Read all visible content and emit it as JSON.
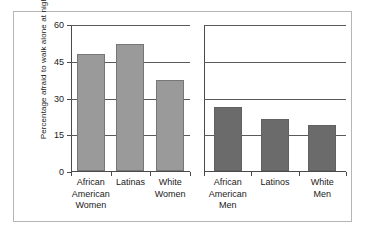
{
  "chart_data": {
    "type": "bar",
    "title": "",
    "xlabel": "",
    "ylabel": "Percentage afraid to walk alone at night",
    "ylim": [
      0,
      60
    ],
    "yticks": [
      0,
      15,
      30,
      45,
      60
    ],
    "grid": true,
    "legend": "none",
    "panels": [
      {
        "name": "Women",
        "color": "#9a9a9a",
        "categories": [
          "African\nAmerican\nWomen",
          "Latinas",
          "White\nWomen"
        ],
        "values": [
          48,
          52,
          37.5
        ]
      },
      {
        "name": "Men",
        "color": "#6b6b6b",
        "categories": [
          "African\nAmerican\nMen",
          "Latinos",
          "White\nMen"
        ],
        "values": [
          26.5,
          21.5,
          19
        ]
      }
    ],
    "categories": [
      "African American Women",
      "Latinas",
      "White Women",
      "African American Men",
      "Latinos",
      "White Men"
    ],
    "values": [
      48,
      52,
      37.5,
      26.5,
      21.5,
      19
    ]
  },
  "axis": {
    "ytick_0": "0",
    "ytick_1": "15",
    "ytick_2": "30",
    "ytick_3": "45",
    "ytick_4": "60"
  },
  "colors": {
    "women_bar": "#9a9a9a",
    "men_bar": "#6b6b6b",
    "gridline": "#5a5a5a",
    "axis": "#4a4a4a",
    "border": "#b5b5b5",
    "background": "#ffffff"
  }
}
